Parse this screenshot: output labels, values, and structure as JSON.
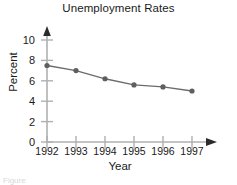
{
  "chart_data": {
    "type": "line",
    "title": "Unemployment Rates",
    "xlabel": "Year",
    "ylabel": "Percent",
    "categories": [
      "1992",
      "1993",
      "1994",
      "1995",
      "1996",
      "1997"
    ],
    "x": [
      1992,
      1993,
      1994,
      1995,
      1996,
      1997
    ],
    "values": [
      7.5,
      7.0,
      6.2,
      5.6,
      5.4,
      5.0
    ],
    "series": [
      {
        "name": "Unemployment Rate",
        "values": [
          7.5,
          7.0,
          6.2,
          5.6,
          5.4,
          5.0
        ]
      }
    ],
    "ylim": [
      0,
      11
    ],
    "xlim": [
      1991.6,
      1997.9
    ],
    "yticks": [
      0,
      2,
      4,
      6,
      8,
      10
    ],
    "ytick_labels": [
      "0",
      "2",
      "4",
      "6",
      "8",
      "10"
    ],
    "xticks": [
      1992,
      1993,
      1994,
      1995,
      1996,
      1997
    ],
    "xtick_labels": [
      "1992",
      "1993",
      "1994",
      "1995",
      "1996",
      "1997"
    ],
    "grid": false,
    "legend": null,
    "legend_position": "none",
    "marker": "circle",
    "line_color": "#6b6b6b",
    "marker_color": "#5f5f5f",
    "axis_color": "#b0b0b0",
    "text_color": "#1a1a1a",
    "background": "#ffffff",
    "axis_arrows": true
  },
  "caption": {
    "partial_text": "Figure"
  }
}
